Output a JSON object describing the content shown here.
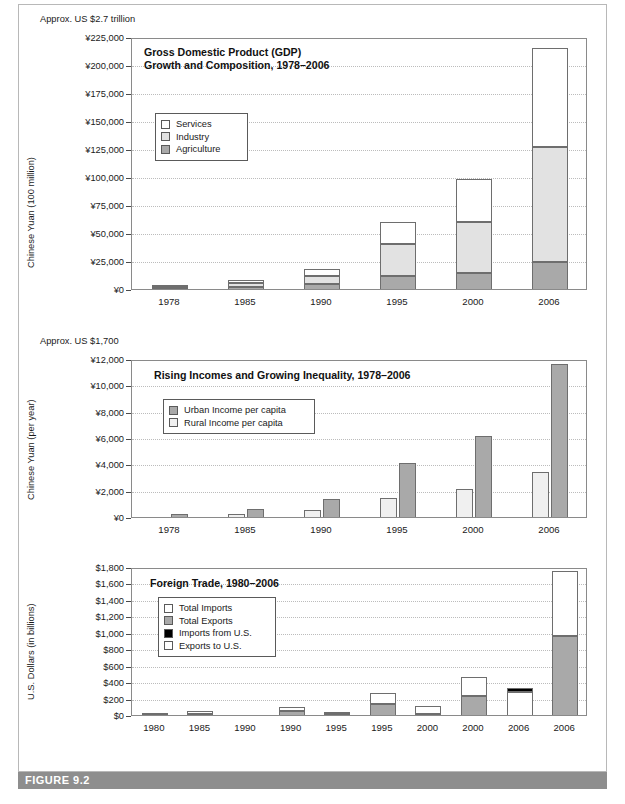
{
  "figure": {
    "caption": "FIGURE 9.2"
  },
  "colors": {
    "services": "#ffffff",
    "industry": "#e2e2e2",
    "agriculture": "#a9a9a9",
    "rural": "#f0f0f0",
    "urban": "#a9a9a9",
    "total_imports": "#ffffff",
    "total_exports": "#a9a9a9",
    "imports_from_us": "#000000",
    "exports_to_us": "#ffffff",
    "frame": "#8a8a8a",
    "grid": "#bcbcbc",
    "caption_bar": "#8e8e8e"
  },
  "chart_data": [
    {
      "id": "gdp",
      "type": "bar",
      "stacked": true,
      "title": "Gross Domestic Product (GDP)\nGrowth and Composition, 1978–2006",
      "note": "Approx. US $2.7 trillion",
      "ylabel": "Chinese Yuan (100 million)",
      "xlabel": "",
      "categories": [
        "1978",
        "1985",
        "1990",
        "1995",
        "2000",
        "2006"
      ],
      "ylim": [
        0,
        225000
      ],
      "ytick_labels": [
        "¥0",
        "¥25,000",
        "¥50,000",
        "¥75,000",
        "¥100,000",
        "¥125,000",
        "¥150,000",
        "¥175,000",
        "¥200,000",
        "¥225,000"
      ],
      "yticks": [
        0,
        25000,
        50000,
        75000,
        100000,
        125000,
        150000,
        175000,
        200000,
        225000
      ],
      "grid": true,
      "legend_position": "inside-top-left",
      "series": [
        {
          "name": "Agriculture",
          "color_key": "agriculture",
          "values": [
            1018,
            2542,
            5017,
            12136,
            14945,
            24737
          ]
        },
        {
          "name": "Industry",
          "color_key": "industry",
          "values": [
            1745,
            3867,
            7717,
            28680,
            45556,
            103162
          ]
        },
        {
          "name": "Services",
          "color_key": "services",
          "values": [
            872,
            2585,
            5888,
            19978,
            38714,
            88555
          ]
        }
      ]
    },
    {
      "id": "incomes",
      "type": "bar",
      "stacked": false,
      "title": "Rising Incomes and Growing Inequality, 1978–2006",
      "note": "Approx. US $1,700",
      "ylabel": "Chinese Yuan (per year)",
      "xlabel": "",
      "categories": [
        "1978",
        "1985",
        "1990",
        "1995",
        "2000",
        "2006"
      ],
      "ylim": [
        0,
        12000
      ],
      "ytick_labels": [
        "¥0",
        "¥2,000",
        "¥4,000",
        "¥6,000",
        "¥8,000",
        "¥10,000",
        "¥12,000"
      ],
      "yticks": [
        0,
        2000,
        4000,
        6000,
        8000,
        10000,
        12000
      ],
      "grid": true,
      "legend_position": "inside-top-left",
      "series": [
        {
          "name": "Rural Income per capita",
          "color_key": "rural",
          "values": [
            134,
            398,
            686,
            1578,
            2253,
            3587
          ]
        },
        {
          "name": "Urban Income per capita",
          "color_key": "urban",
          "values": [
            343,
            739,
            1510,
            4283,
            6280,
            11759
          ]
        }
      ]
    },
    {
      "id": "trade",
      "type": "bar",
      "stacked": true,
      "title": "Foreign Trade, 1980–2006",
      "note": "",
      "ylabel": "U.S. Dollars (in billions)",
      "xlabel": "",
      "categories": [
        "1980",
        "1985",
        "1990",
        "1990",
        "1995",
        "1995",
        "2000",
        "2000",
        "2006",
        "2006"
      ],
      "ylim": [
        0,
        1800
      ],
      "ytick_labels": [
        "$0",
        "$200",
        "$400",
        "$600",
        "$800",
        "$1,000",
        "$1,200",
        "$1,400",
        "$1,600",
        "$1,800"
      ],
      "yticks": [
        0,
        200,
        400,
        600,
        800,
        1000,
        1200,
        1400,
        1600,
        1800
      ],
      "grid": true,
      "legend_position": "inside-top-left",
      "legend_entries": [
        {
          "name": "Total Imports",
          "color_key": "total_imports"
        },
        {
          "name": "Total Exports",
          "color_key": "total_exports"
        },
        {
          "name": "Imports from U.S.",
          "color_key": "imports_from_us"
        },
        {
          "name": "Exports to U.S.",
          "color_key": "exports_to_us"
        }
      ],
      "bars": [
        {
          "label": "1980",
          "segments": [
            {
              "color_key": "total_exports",
              "value": 10
            },
            {
              "color_key": "total_imports",
              "value": 18
            }
          ]
        },
        {
          "label": "1985",
          "segments": [
            {
              "color_key": "total_exports",
              "value": 20
            },
            {
              "color_key": "total_imports",
              "value": 35
            }
          ]
        },
        {
          "label": "1990",
          "segments": [
            {
              "color_key": "imports_from_us",
              "value": 14
            }
          ]
        },
        {
          "label": "1990",
          "segments": [
            {
              "color_key": "total_exports",
              "value": 62
            },
            {
              "color_key": "total_imports",
              "value": 50
            }
          ]
        },
        {
          "label": "1995",
          "segments": [
            {
              "color_key": "imports_from_us",
              "value": 24
            },
            {
              "color_key": "exports_to_us",
              "value": 18
            }
          ]
        },
        {
          "label": "1995",
          "segments": [
            {
              "color_key": "total_exports",
              "value": 149
            },
            {
              "color_key": "total_imports",
              "value": 132
            }
          ]
        },
        {
          "label": "2000",
          "segments": [
            {
              "color_key": "imports_from_us",
              "value": 22
            },
            {
              "color_key": "exports_to_us",
              "value": 100
            }
          ]
        },
        {
          "label": "2000",
          "segments": [
            {
              "color_key": "total_exports",
              "value": 249
            },
            {
              "color_key": "total_imports",
              "value": 225
            }
          ]
        },
        {
          "label": "2006",
          "segments": [
            {
              "color_key": "exports_to_us",
              "value": 288
            },
            {
              "color_key": "imports_from_us",
              "value": 55
            }
          ]
        },
        {
          "label": "2006",
          "segments": [
            {
              "color_key": "total_exports",
              "value": 969
            },
            {
              "color_key": "total_imports",
              "value": 791
            }
          ]
        }
      ]
    }
  ]
}
